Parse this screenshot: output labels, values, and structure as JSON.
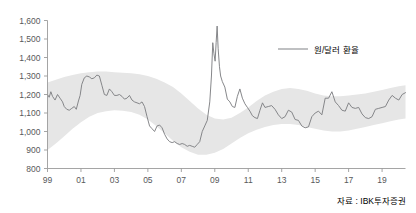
{
  "chart_data": {
    "type": "line",
    "title": "",
    "subtitle": "",
    "xlabel": "",
    "ylabel": "",
    "ylim": [
      800,
      1600
    ],
    "ytick_values": [
      800,
      900,
      1000,
      1100,
      1200,
      1300,
      1400,
      1500,
      1600
    ],
    "ytick_labels": [
      "800",
      "900",
      "1,000",
      "1,100",
      "1,200",
      "1,300",
      "1,400",
      "1,500",
      "1,600"
    ],
    "xlim": [
      1999,
      2020.4
    ],
    "xtick_values": [
      1999,
      2001,
      2003,
      2005,
      2007,
      2009,
      2011,
      2013,
      2015,
      2017,
      2019
    ],
    "xtick_labels": [
      "99",
      "01",
      "03",
      "05",
      "07",
      "09",
      "11",
      "13",
      "15",
      "17",
      "19"
    ],
    "grid": false,
    "legend_position": "top-right",
    "legend": [
      "원/달러 환율"
    ],
    "series": [
      {
        "name": "원/달러 환율",
        "color": "#7f8184",
        "x": [
          1999.0,
          1999.1,
          1999.2,
          1999.3,
          1999.45,
          1999.6,
          1999.75,
          1999.9,
          2000.0,
          2000.15,
          2000.3,
          2000.45,
          2000.6,
          2000.72,
          2000.85,
          2000.95,
          2001.05,
          2001.2,
          2001.35,
          2001.5,
          2001.65,
          2001.8,
          2001.95,
          2002.1,
          2002.25,
          2002.4,
          2002.55,
          2002.7,
          2002.85,
          2003.0,
          2003.15,
          2003.3,
          2003.45,
          2003.6,
          2003.75,
          2003.9,
          2004.05,
          2004.2,
          2004.35,
          2004.5,
          2004.65,
          2004.8,
          2004.95,
          2005.1,
          2005.25,
          2005.4,
          2005.55,
          2005.7,
          2005.85,
          2006.0,
          2006.15,
          2006.3,
          2006.45,
          2006.6,
          2006.75,
          2006.9,
          2007.05,
          2007.2,
          2007.35,
          2007.5,
          2007.65,
          2007.8,
          2007.95,
          2008.1,
          2008.25,
          2008.4,
          2008.55,
          2008.7,
          2008.8,
          2008.88,
          2008.95,
          2009.02,
          2009.08,
          2009.14,
          2009.2,
          2009.28,
          2009.35,
          2009.45,
          2009.6,
          2009.75,
          2009.9,
          2010.05,
          2010.2,
          2010.35,
          2010.5,
          2010.65,
          2010.8,
          2010.95,
          2011.1,
          2011.25,
          2011.4,
          2011.55,
          2011.7,
          2011.85,
          2012.0,
          2012.2,
          2012.4,
          2012.6,
          2012.8,
          2013.0,
          2013.2,
          2013.4,
          2013.6,
          2013.8,
          2014.0,
          2014.2,
          2014.4,
          2014.6,
          2014.8,
          2015.0,
          2015.2,
          2015.4,
          2015.6,
          2015.8,
          2016.0,
          2016.2,
          2016.4,
          2016.6,
          2016.8,
          2017.0,
          2017.2,
          2017.4,
          2017.6,
          2017.8,
          2018.0,
          2018.2,
          2018.4,
          2018.6,
          2018.8,
          2019.0,
          2019.2,
          2019.4,
          2019.6,
          2019.8,
          2020.0,
          2020.2,
          2020.4
        ],
        "y": [
          1200,
          1185,
          1215,
          1190,
          1170,
          1200,
          1180,
          1160,
          1135,
          1120,
          1115,
          1125,
          1135,
          1120,
          1165,
          1195,
          1255,
          1290,
          1300,
          1295,
          1285,
          1290,
          1305,
          1300,
          1250,
          1200,
          1195,
          1230,
          1215,
          1195,
          1195,
          1200,
          1190,
          1175,
          1180,
          1195,
          1170,
          1160,
          1155,
          1150,
          1160,
          1135,
          1080,
          1030,
          1015,
          1000,
          1030,
          1035,
          1020,
          985,
          960,
          945,
          940,
          945,
          935,
          930,
          935,
          930,
          920,
          925,
          920,
          915,
          930,
          945,
          1000,
          1030,
          1060,
          1160,
          1300,
          1480,
          1420,
          1380,
          1480,
          1570,
          1450,
          1350,
          1300,
          1270,
          1240,
          1175,
          1160,
          1135,
          1130,
          1190,
          1230,
          1180,
          1150,
          1130,
          1110,
          1085,
          1075,
          1070,
          1115,
          1155,
          1130,
          1135,
          1140,
          1120,
          1090,
          1070,
          1080,
          1115,
          1105,
          1065,
          1060,
          1030,
          1020,
          1025,
          1080,
          1100,
          1110,
          1090,
          1180,
          1180,
          1215,
          1160,
          1140,
          1115,
          1110,
          1155,
          1130,
          1125,
          1130,
          1095,
          1075,
          1070,
          1080,
          1120,
          1125,
          1130,
          1135,
          1170,
          1195,
          1180,
          1170,
          1200,
          1210
        ]
      }
    ],
    "band": {
      "name": "range-band",
      "color": "#e6e6e6",
      "x": [
        1999.0,
        1999.5,
        2000.0,
        2000.5,
        2001.0,
        2001.5,
        2002.0,
        2002.5,
        2003.0,
        2003.5,
        2004.0,
        2004.5,
        2005.0,
        2005.5,
        2006.0,
        2006.5,
        2007.0,
        2007.5,
        2008.0,
        2008.5,
        2009.0,
        2009.5,
        2010.0,
        2010.5,
        2011.0,
        2011.5,
        2012.0,
        2012.5,
        2013.0,
        2013.5,
        2014.0,
        2014.5,
        2015.0,
        2015.5,
        2016.0,
        2016.5,
        2017.0,
        2017.5,
        2018.0,
        2018.5,
        2019.0,
        2019.5,
        2020.0,
        2020.4
      ],
      "upper": [
        1265,
        1280,
        1295,
        1305,
        1315,
        1320,
        1325,
        1325,
        1320,
        1318,
        1315,
        1310,
        1300,
        1285,
        1265,
        1240,
        1205,
        1165,
        1125,
        1090,
        1070,
        1065,
        1075,
        1100,
        1130,
        1165,
        1195,
        1215,
        1230,
        1235,
        1230,
        1220,
        1205,
        1195,
        1190,
        1190,
        1195,
        1200,
        1205,
        1215,
        1225,
        1235,
        1245,
        1250
      ],
      "lower": [
        900,
        935,
        975,
        1015,
        1050,
        1080,
        1100,
        1110,
        1115,
        1112,
        1105,
        1090,
        1065,
        1030,
        990,
        950,
        915,
        890,
        875,
        875,
        885,
        905,
        935,
        965,
        990,
        1010,
        1025,
        1035,
        1040,
        1040,
        1035,
        1025,
        1015,
        1005,
        1000,
        1000,
        1005,
        1015,
        1025,
        1035,
        1045,
        1055,
        1065,
        1070
      ]
    },
    "source": "자료 : IBK투자증권"
  },
  "legend": {
    "series_label": "원/달러 환율"
  },
  "footer": {
    "source": "자료 : IBK투자증권"
  },
  "colors": {
    "line": "#7f8184",
    "band": "#e6e6e6",
    "axis": "#9b9b9b",
    "text": "#58595b"
  }
}
